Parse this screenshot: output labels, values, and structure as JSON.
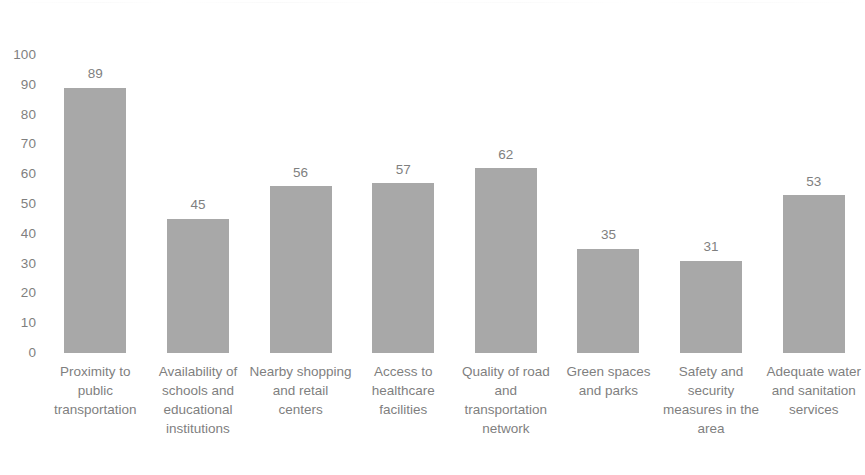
{
  "chart_data": {
    "type": "bar",
    "title": "",
    "subtitle": "",
    "xlabel": "",
    "ylabel": "",
    "ylim": [
      0,
      100
    ],
    "y_ticks": [
      100,
      90,
      80,
      70,
      60,
      50,
      40,
      30,
      20,
      10,
      0
    ],
    "grid": false,
    "legend": false,
    "legend_position": "none",
    "bar_color": "#a8a8a8",
    "text_color": "#7f7f7f",
    "background_color": "#ffffff",
    "data_labels_shown": true,
    "categories": [
      "Proximity to public transportation",
      "Availability of schools and educational institutions",
      "Nearby shopping and retail centers",
      "Access to healthcare facilities",
      "Quality of road and transportation network",
      "Green spaces and parks",
      "Safety and security measures in the area",
      "Adequate water and sanitation services"
    ],
    "values": [
      89,
      45,
      56,
      57,
      62,
      35,
      31,
      53
    ],
    "value_labels": [
      "89",
      "45",
      "56",
      "57",
      "62",
      "35",
      "31",
      "53"
    ]
  }
}
